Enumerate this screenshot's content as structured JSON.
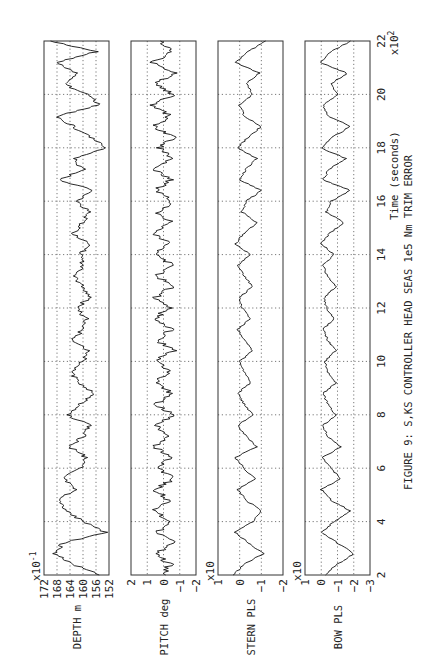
{
  "figure": {
    "caption": "FIGURE 9: S,KS CONTROLLER  HEAD SEAS  1e5 Nm TRIM ERROR",
    "orientation": "rotated 90° counter-clockwise",
    "background": "#ffffff",
    "ink": "#111111"
  },
  "chart_data": [
    {
      "type": "line",
      "title": "DEPTH",
      "ylabel": "DEPTH m",
      "y_multiplier": "x10^-1",
      "yticks": [
        152,
        156,
        160,
        164,
        168,
        172
      ],
      "ylim": [
        152,
        172
      ],
      "xlabel": "Time (seconds)",
      "x_multiplier": "x10^2",
      "xticks": [
        2,
        4,
        6,
        8,
        10,
        12,
        14,
        16,
        18,
        20,
        22
      ],
      "xlim": [
        2,
        22
      ],
      "grid": true,
      "x": [
        2.0,
        2.4,
        2.8,
        3.2,
        3.6,
        4.0,
        4.4,
        4.8,
        5.2,
        5.6,
        6.0,
        6.4,
        6.8,
        7.2,
        7.6,
        8.0,
        8.4,
        8.8,
        9.2,
        9.6,
        10.0,
        10.4,
        10.8,
        11.2,
        11.6,
        12.0,
        12.4,
        12.8,
        13.2,
        13.6,
        14.0,
        14.4,
        14.8,
        15.2,
        15.6,
        16.0,
        16.4,
        16.8,
        17.2,
        17.6,
        18.0,
        18.4,
        18.8,
        19.2,
        19.6,
        20.0,
        20.4,
        20.8,
        21.2,
        21.6,
        22.0
      ],
      "values": [
        155,
        163,
        169,
        166,
        153,
        160,
        165,
        168,
        162,
        166,
        161,
        159,
        164,
        160,
        158,
        165,
        161,
        157,
        161,
        164,
        160,
        158,
        163,
        160,
        159,
        162,
        158,
        160,
        163,
        160,
        161,
        158,
        163,
        160,
        158,
        162,
        157,
        167,
        160,
        163,
        153,
        158,
        163,
        168,
        155,
        159,
        166,
        162,
        168,
        156,
        170
      ]
    },
    {
      "type": "line",
      "title": "PITCH",
      "ylabel": "PITCH deg",
      "yticks": [
        -2,
        -1,
        0,
        1,
        2
      ],
      "ylim": [
        -2,
        2
      ],
      "xlim": [
        2,
        22
      ],
      "grid": true,
      "x": [
        2.0,
        2.4,
        2.8,
        3.2,
        3.6,
        4.0,
        4.4,
        4.8,
        5.2,
        5.6,
        6.0,
        6.4,
        6.8,
        7.2,
        7.6,
        8.0,
        8.4,
        8.8,
        9.2,
        9.6,
        10.0,
        10.4,
        10.8,
        11.2,
        11.6,
        12.0,
        12.4,
        12.8,
        13.2,
        13.6,
        14.0,
        14.4,
        14.8,
        15.2,
        15.6,
        16.0,
        16.4,
        16.8,
        17.2,
        17.6,
        18.0,
        18.4,
        18.8,
        19.2,
        19.6,
        20.0,
        20.4,
        20.8,
        21.2,
        21.6,
        22.0
      ],
      "values": [
        0.1,
        -0.4,
        0.5,
        -0.6,
        0.4,
        -0.5,
        0.6,
        -0.3,
        0.5,
        -0.6,
        0.3,
        -0.5,
        0.6,
        -0.4,
        0.5,
        -0.6,
        0.4,
        -0.5,
        0.6,
        -0.3,
        0.5,
        -0.6,
        0.4,
        -0.5,
        0.6,
        -0.4,
        0.5,
        -0.5,
        0.4,
        -0.6,
        0.5,
        -0.4,
        0.6,
        -0.5,
        0.4,
        -0.6,
        0.5,
        -0.4,
        0.6,
        -0.5,
        0.3,
        -0.7,
        0.6,
        -0.4,
        0.7,
        -0.6,
        0.5,
        -0.7,
        0.6,
        -0.5,
        0.2
      ]
    },
    {
      "type": "line",
      "title": "STERN PLS",
      "ylabel": "STERN PLS",
      "y_multiplier": "x10",
      "yticks": [
        -2,
        -1,
        0,
        1
      ],
      "ylim": [
        -2,
        1
      ],
      "xlim": [
        2,
        22
      ],
      "grid": true,
      "x": [
        2.0,
        2.4,
        2.8,
        3.2,
        3.6,
        4.0,
        4.4,
        4.8,
        5.2,
        5.6,
        6.0,
        6.4,
        6.8,
        7.2,
        7.6,
        8.0,
        8.4,
        8.8,
        9.2,
        9.6,
        10.0,
        10.4,
        10.8,
        11.2,
        11.6,
        12.0,
        12.4,
        12.8,
        13.2,
        13.6,
        14.0,
        14.4,
        14.8,
        15.2,
        15.6,
        16.0,
        16.4,
        16.8,
        17.2,
        17.6,
        18.0,
        18.4,
        18.8,
        19.2,
        19.6,
        20.0,
        20.4,
        20.8,
        21.2,
        21.6,
        22.0
      ],
      "values": [
        0.3,
        -0.2,
        -1.1,
        -0.4,
        0.2,
        -0.6,
        -1.0,
        -0.3,
        0.1,
        -0.7,
        -0.2,
        0.2,
        -0.8,
        -0.3,
        0.1,
        -0.6,
        -0.2,
        0.1,
        -0.5,
        -0.2,
        0.0,
        -0.6,
        -0.2,
        0.1,
        -0.5,
        -0.1,
        0.0,
        -0.6,
        -0.2,
        0.1,
        -0.5,
        0.2,
        -0.2,
        -0.8,
        -0.1,
        -0.3,
        -1.0,
        0.0,
        -0.3,
        -0.8,
        0.1,
        -0.4,
        -1.0,
        -0.2,
        0.0,
        -0.6,
        -0.3,
        -0.9,
        0.2,
        -0.4,
        -1.2
      ]
    },
    {
      "type": "line",
      "title": "BOW PLS",
      "ylabel": "BOW PLS",
      "y_multiplier": "x10",
      "yticks": [
        -3,
        -2,
        -1,
        0,
        1
      ],
      "ylim": [
        -3,
        1
      ],
      "xlim": [
        2,
        22
      ],
      "grid": true,
      "x": [
        2.0,
        2.4,
        2.8,
        3.2,
        3.6,
        4.0,
        4.4,
        4.8,
        5.2,
        5.6,
        6.0,
        6.4,
        6.8,
        7.2,
        7.6,
        8.0,
        8.4,
        8.8,
        9.2,
        9.6,
        10.0,
        10.4,
        10.8,
        11.2,
        11.6,
        12.0,
        12.4,
        12.8,
        13.2,
        13.6,
        14.0,
        14.4,
        14.8,
        15.2,
        15.6,
        16.0,
        16.4,
        16.8,
        17.2,
        17.6,
        18.0,
        18.4,
        18.8,
        19.2,
        19.6,
        20.0,
        20.4,
        20.8,
        21.2,
        21.6,
        22.0
      ],
      "values": [
        -0.2,
        -1.0,
        -2.0,
        -1.0,
        0.0,
        -0.8,
        -1.8,
        -0.6,
        0.0,
        -1.2,
        -0.6,
        -0.1,
        -1.2,
        -0.4,
        -0.1,
        -0.9,
        -0.4,
        -0.1,
        -0.9,
        -0.4,
        -0.2,
        -0.9,
        -0.4,
        -0.1,
        -0.8,
        -0.3,
        -0.2,
        -0.9,
        -0.4,
        -0.1,
        -0.8,
        0.0,
        -0.5,
        -1.4,
        -0.3,
        -0.6,
        -1.8,
        -0.1,
        -0.5,
        -1.5,
        0.0,
        -0.7,
        -1.8,
        -0.4,
        -0.1,
        -1.0,
        -0.6,
        -1.6,
        0.1,
        -0.6,
        -1.8
      ]
    }
  ],
  "axes": {
    "time_label": "Time (seconds)",
    "time_multiplier": "x10",
    "time_multiplier_exp": "2",
    "depth_multiplier": "x10",
    "depth_multiplier_exp": "-1"
  }
}
